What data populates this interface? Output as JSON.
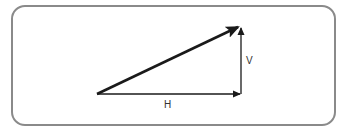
{
  "diagram": {
    "type": "vector-triangle",
    "labels": {
      "horizontal": "H",
      "vertical": "V"
    },
    "colors": {
      "frame_border": "#8a8a8a",
      "arrows": "#1a1a1a",
      "text": "#333333"
    },
    "vectors": [
      {
        "name": "H",
        "from": [
          97,
          94
        ],
        "to": [
          241,
          94
        ]
      },
      {
        "name": "V",
        "from": [
          241,
          94
        ],
        "to": [
          241,
          27
        ]
      },
      {
        "name": "resultant",
        "from": [
          97,
          94
        ],
        "to": [
          241,
          27
        ]
      }
    ]
  }
}
